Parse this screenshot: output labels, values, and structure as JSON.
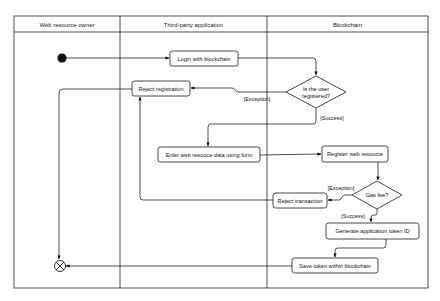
{
  "diagram": {
    "type": "UML activity diagram with swimlanes",
    "lanes": [
      {
        "id": "owner",
        "label": "Web resource owner"
      },
      {
        "id": "app",
        "label": "Third-party application"
      },
      {
        "id": "chain",
        "label": "Blockchain"
      }
    ],
    "nodes": {
      "start": {
        "type": "initial",
        "lane": "owner"
      },
      "login": {
        "type": "action",
        "lane": "app",
        "label": "Login with blockchain"
      },
      "registered": {
        "type": "decision",
        "lane": "chain",
        "label_line1": "Is the user",
        "label_line2": "registered?"
      },
      "reject_registration": {
        "type": "action",
        "lane": "app",
        "label": "Reject registration"
      },
      "enter_data": {
        "type": "action",
        "lane": "app",
        "label": "Enter web resouce data using form"
      },
      "register_resource": {
        "type": "action",
        "lane": "chain",
        "label": "Register web resource"
      },
      "gas_fee": {
        "type": "decision",
        "lane": "chain",
        "label": "Gas fee?"
      },
      "reject_transaction": {
        "type": "action",
        "lane": "chain",
        "label": "Reject transaction"
      },
      "generate_token": {
        "type": "action",
        "lane": "chain",
        "label": "Generate application token ID"
      },
      "save_token": {
        "type": "action",
        "lane": "chain",
        "label": "Save token within blockchain"
      },
      "end": {
        "type": "final",
        "lane": "owner"
      }
    },
    "guards": {
      "registered_exception": "[Exception]",
      "registered_success": "[Success]",
      "gas_exception": "[Exception]",
      "gas_success": "[Success]"
    },
    "edges": [
      {
        "from": "start",
        "to": "login"
      },
      {
        "from": "login",
        "to": "registered"
      },
      {
        "from": "registered",
        "to": "reject_registration",
        "guard": "[Exception]"
      },
      {
        "from": "registered",
        "to": "enter_data",
        "guard": "[Success]"
      },
      {
        "from": "enter_data",
        "to": "register_resource"
      },
      {
        "from": "register_resource",
        "to": "gas_fee"
      },
      {
        "from": "gas_fee",
        "to": "reject_transaction",
        "guard": "[Exception]"
      },
      {
        "from": "gas_fee",
        "to": "generate_token",
        "guard": "[Success]"
      },
      {
        "from": "reject_transaction",
        "to": "reject_registration"
      },
      {
        "from": "generate_token",
        "to": "save_token"
      },
      {
        "from": "save_token",
        "to": "end"
      },
      {
        "from": "reject_registration",
        "to": "end"
      }
    ]
  }
}
